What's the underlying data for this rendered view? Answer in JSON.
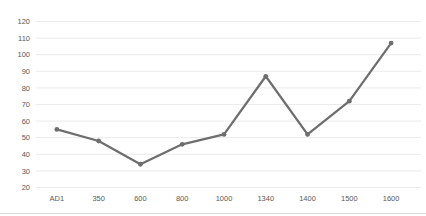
{
  "chart_data": {
    "type": "line",
    "title": "",
    "xlabel": "",
    "ylabel": "",
    "categories": [
      "AD1",
      "350",
      "600",
      "800",
      "1000",
      "1340",
      "1400",
      "1500",
      "1600"
    ],
    "values": [
      55,
      48,
      34,
      46,
      52,
      87,
      52,
      72,
      107
    ],
    "ylim": [
      20,
      120
    ],
    "yticks": [
      20,
      30,
      40,
      50,
      60,
      70,
      80,
      90,
      100,
      110,
      120
    ],
    "grid": true,
    "legend": false,
    "line_color": "#6e6e6e",
    "marker_color": "#6e6e6e",
    "grid_color": "#ebebeb",
    "label_color": "#595959",
    "bottom_border_color": "#d9d9d9",
    "background_color": "#ffffff"
  }
}
